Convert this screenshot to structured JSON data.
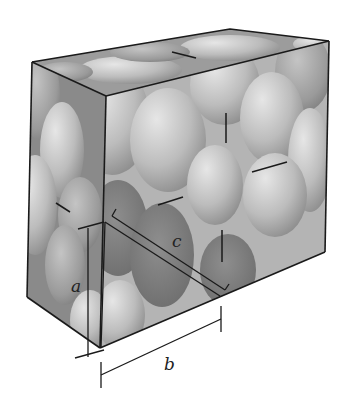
{
  "figure": {
    "labels": {
      "a": "a",
      "b": "b",
      "c": "c"
    },
    "colors": {
      "background": "#ffffff",
      "edge": "#1a1a1a",
      "face_light": "#c8c8c8",
      "face_mid": "#a8a8a8",
      "particle_light": "#d6d6d6",
      "particle_mid": "#a9a9a9",
      "particle_dark": "#7d7d7d"
    }
  }
}
